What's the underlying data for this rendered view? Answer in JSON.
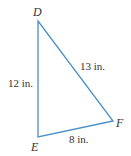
{
  "diagram": {
    "type": "right-triangle",
    "stroke_color": "#4a8fc9",
    "vertices": [
      {
        "name": "D",
        "x": 38,
        "y": 21
      },
      {
        "name": "E",
        "x": 38,
        "y": 137
      },
      {
        "name": "F",
        "x": 113,
        "y": 121
      }
    ],
    "sides": {
      "DE": "12 in.",
      "DF": "13 in.",
      "EF": "8 in."
    },
    "labels": {
      "vertex_d": "D",
      "vertex_e": "E",
      "vertex_f": "F"
    }
  }
}
